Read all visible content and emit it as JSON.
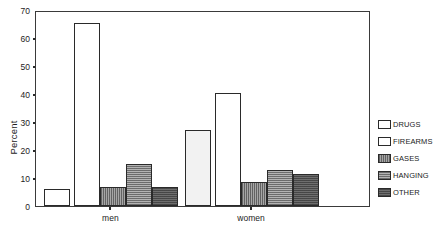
{
  "chart_data": {
    "type": "bar",
    "title": "",
    "xlabel": "",
    "ylabel": "Percent",
    "categories": [
      "men",
      "women"
    ],
    "ylim": [
      0,
      70
    ],
    "yticks": [
      0,
      10,
      20,
      30,
      40,
      50,
      60,
      70
    ],
    "ytick_labels": [
      "0",
      "10",
      "20",
      "30",
      "40",
      "50",
      "60",
      "70"
    ],
    "grid": false,
    "legend_position": "right",
    "series": [
      {
        "name": "DRUGS",
        "values": [
          6.0,
          27.0
        ],
        "swatch": "#ffffff"
      },
      {
        "name": "FIREARMS",
        "values": [
          65.3,
          40.3
        ],
        "swatch": "#ffffff"
      },
      {
        "name": "GASES",
        "values": [
          6.8,
          8.5
        ],
        "swatch": "#8d8d8d"
      },
      {
        "name": "HANGING",
        "values": [
          15.0,
          13.0
        ],
        "swatch": "#9a9a9a"
      },
      {
        "name": "OTHER",
        "values": [
          6.8,
          11.5
        ],
        "swatch": "#5e5e5e"
      }
    ]
  },
  "legend": {
    "items": [
      {
        "label": "DRUGS"
      },
      {
        "label": "FIREARMS"
      },
      {
        "label": "GASES"
      },
      {
        "label": "HANGING"
      },
      {
        "label": "OTHER"
      }
    ]
  },
  "axis": {
    "y_title": "Percent",
    "y_ticks": [
      "70",
      "60",
      "50",
      "40",
      "30",
      "20",
      "10",
      "0"
    ],
    "x_groups": [
      "men",
      "women"
    ]
  }
}
